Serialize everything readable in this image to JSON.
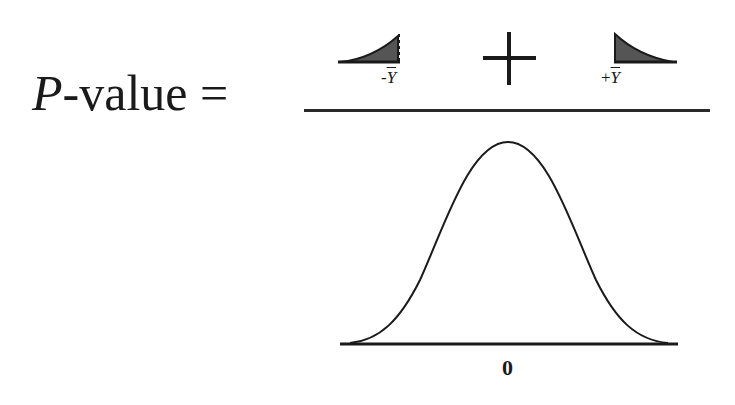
{
  "equation": {
    "lhs_symbol": "P",
    "lhs_text": "-value =",
    "numerator": {
      "left_tail_label_sign": "-",
      "left_tail_label_var": "Y",
      "operator": "+",
      "right_tail_label_sign": "+",
      "right_tail_label_var": "Y"
    },
    "denominator": {
      "curve": "normal-distribution",
      "axis_label": "0"
    }
  },
  "colors": {
    "ink": "#1a1a1a",
    "tail_fill": "#555555"
  }
}
